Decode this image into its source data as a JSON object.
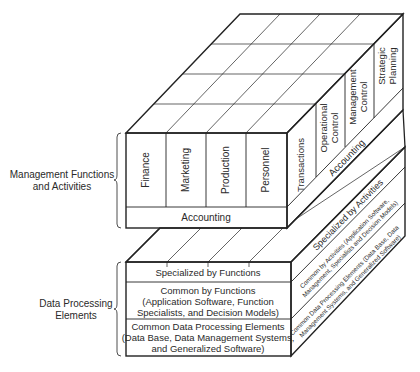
{
  "labels": {
    "management": [
      "Management Functions",
      "and Activities"
    ],
    "data_processing": [
      "Data Processing",
      "Elements"
    ]
  },
  "top_cube": {
    "front_columns": [
      "Finance",
      "Marketing",
      "Production",
      "Personnel"
    ],
    "front_bottom_band": "Accounting",
    "side_columns": [
      "Transactions",
      "Operational Control",
      "Management Control",
      "Strategic Planning"
    ],
    "side_columns_lines": [
      [
        "Transactions"
      ],
      [
        "Operational",
        "Control"
      ],
      [
        "Management",
        "Control"
      ],
      [
        "Strategic",
        "Planning"
      ]
    ],
    "side_bottom_band": "Accounting"
  },
  "bottom_box": {
    "front_rows": [
      [
        "Specialized by Functions"
      ],
      [
        "Common by Functions",
        "(Application Software, Function",
        "Specialists, and Decision Models)"
      ],
      [
        "Common Data Processing Elements",
        "(Data Base, Data Management Systems,",
        "and Generalized Software)"
      ]
    ],
    "side_rows": [
      [
        "Specialized by Activities"
      ],
      [
        "Common by Activities (Application Software,",
        "Management, Specialists and Decision Models)"
      ],
      [
        "Common Data Processing Elements (Data Base, Data",
        "Management Systems, and Generalized Software)"
      ]
    ]
  }
}
